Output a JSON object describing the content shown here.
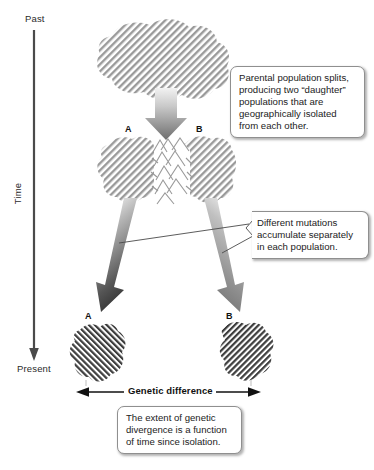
{
  "figure": {
    "background_color": "#ffffff"
  },
  "time_axis": {
    "top_label": "Past",
    "bottom_label": "Present",
    "axis_name": "Time",
    "axis_color": "#4a4a4a",
    "direction": "downward"
  },
  "populations": {
    "parental": {
      "stage": "Parental population",
      "hatch_direction": "backslash",
      "hatch_color": "#9a9a9a"
    },
    "middle": [
      {
        "label": "A",
        "hatch_direction": "backslash",
        "hatch_color": "#9a9a9a"
      },
      {
        "label": "B",
        "hatch_direction": "backslash",
        "hatch_color": "#9a9a9a"
      }
    ],
    "present": [
      {
        "label": "A",
        "hatch_direction": "slash",
        "hatch_color": "#3d3d3d"
      },
      {
        "label": "B",
        "hatch_direction": "backslash",
        "hatch_color": "#3d3d3d"
      }
    ],
    "barrier": {
      "name": "mountain-range",
      "color": "#9a9a9a"
    }
  },
  "callouts": {
    "split": {
      "text": "Parental population splits, producing two “daughter” populations that are geographically isolated from each other."
    },
    "mutations": {
      "text": "Different mutations accumulate separately in each population."
    },
    "extent": {
      "text": "The extent of genetic divergence is a function of time since isolation."
    }
  },
  "measure": {
    "label": "Genetic difference",
    "arrow_style": "double-headed",
    "color": "#111111"
  },
  "arrows": {
    "split_arrow": {
      "name": "downward-split-arrow",
      "gradient_from": "#e8e8e8",
      "gradient_to": "#6e6e6e"
    },
    "diverge_left": {
      "name": "diverge-arrow-a",
      "gradient_from": "#e8e8e8",
      "gradient_to": "#2f2f2f"
    },
    "diverge_right": {
      "name": "diverge-arrow-b",
      "gradient_from": "#e8e8e8",
      "gradient_to": "#7a7a7a"
    }
  }
}
